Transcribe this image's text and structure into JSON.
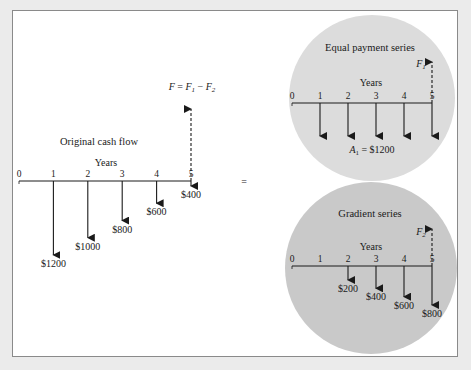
{
  "colors": {
    "background": "#ebebeb",
    "panel": "#ffffff",
    "panel_border": "#8a8a8a",
    "equal_circle": "#dcdcdc",
    "gradient_circle": "#c9c9c9",
    "ink": "#1a1a1a"
  },
  "original": {
    "title": "Original cash flow",
    "axis_label": "Years",
    "ticks": [
      "0",
      "1",
      "2",
      "3",
      "4",
      "5"
    ],
    "flows": [
      {
        "year": 1,
        "amount": 1200,
        "label": "$1200"
      },
      {
        "year": 2,
        "amount": 1000,
        "label": "$1000"
      },
      {
        "year": 3,
        "amount": 800,
        "label": "$800"
      },
      {
        "year": 4,
        "amount": 600,
        "label": "$600"
      },
      {
        "year": 5,
        "amount": 400,
        "label": "$400"
      }
    ],
    "future_value": {
      "year": 5,
      "symbol": "F",
      "equation_lhs": "F",
      "equation_eq": " = ",
      "f1": "F",
      "f1_sub": "1",
      "minus": " − ",
      "f2": "F",
      "f2_sub": "2"
    }
  },
  "equals_sign": "=",
  "equal_payment": {
    "title": "Equal payment series",
    "axis_label": "Years",
    "ticks": [
      "0",
      "1",
      "2",
      "3",
      "4",
      "5"
    ],
    "flows": [
      {
        "year": 1,
        "amount": 1200
      },
      {
        "year": 2,
        "amount": 1200
      },
      {
        "year": 3,
        "amount": 1200
      },
      {
        "year": 4,
        "amount": 1200
      },
      {
        "year": 5,
        "amount": 1200
      }
    ],
    "annuity_symbol": "A",
    "annuity_sub": "1",
    "annuity_value": " = $1200",
    "future_symbol": "F",
    "future_sub": "1"
  },
  "gradient": {
    "title": "Gradient series",
    "axis_label": "Years",
    "ticks": [
      "0",
      "1",
      "2",
      "3",
      "4",
      "5"
    ],
    "flows": [
      {
        "year": 2,
        "amount": 200,
        "label": "$200"
      },
      {
        "year": 3,
        "amount": 400,
        "label": "$400"
      },
      {
        "year": 4,
        "amount": 600,
        "label": "$600"
      },
      {
        "year": 5,
        "amount": 800,
        "label": "$800"
      }
    ],
    "future_symbol": "F",
    "future_sub": "2"
  }
}
